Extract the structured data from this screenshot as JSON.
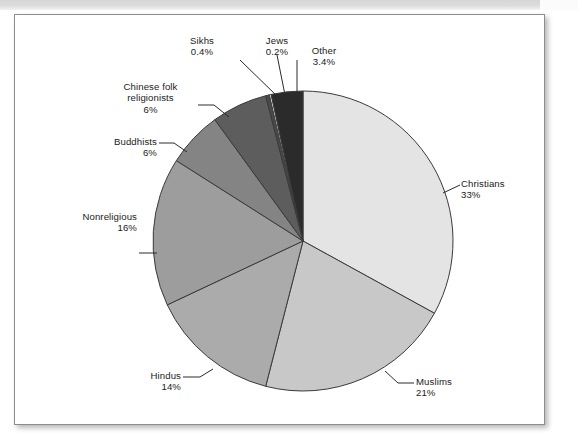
{
  "figure": {
    "background_color": "#ffffff",
    "frame_border_color": "#8d8d8d"
  },
  "chart_data": {
    "type": "pie",
    "title": "",
    "subtitle": "",
    "xlabel": "",
    "ylabel": "",
    "legend_position": "none (labels with leader lines outside slices)",
    "grid": false,
    "start_angle_deg": 0,
    "direction": "clockwise from 12 o'clock",
    "categories": [
      "Christians",
      "Muslims",
      "Hindus",
      "Nonreligious",
      "Buddhists",
      "Chinese folk religionists",
      "Sikhs",
      "Jews",
      "Other"
    ],
    "values": [
      33,
      21,
      14,
      16,
      6,
      6,
      0.4,
      0.2,
      3.4
    ],
    "value_labels": [
      "33%",
      "21%",
      "14%",
      "16%",
      "6%",
      "6%",
      "0.4%",
      "0.2%",
      "3.4%"
    ],
    "colors": [
      "#e4e4e4",
      "#c8c8c8",
      "#ababab",
      "#9d9d9d",
      "#848484",
      "#5d5d5d",
      "#4a4a4a",
      "#f3f3f3",
      "#2b2b2b"
    ],
    "slice_edge_color": "#3a3a3a",
    "slices": [
      {
        "label": "Christians",
        "value": 33,
        "value_label": "33%",
        "color": "#e4e4e4"
      },
      {
        "label": "Muslims",
        "value": 21,
        "value_label": "21%",
        "color": "#c8c8c8"
      },
      {
        "label": "Hindus",
        "value": 14,
        "value_label": "14%",
        "color": "#ababab"
      },
      {
        "label": "Nonreligious",
        "value": 16,
        "value_label": "16%",
        "color": "#9d9d9d"
      },
      {
        "label": "Buddhists",
        "value": 6,
        "value_label": "6%",
        "color": "#848484"
      },
      {
        "label": "Chinese folk religionists",
        "value": 6,
        "value_label": "6%",
        "color": "#5d5d5d"
      },
      {
        "label": "Sikhs",
        "value": 0.4,
        "value_label": "0.4%",
        "color": "#4a4a4a"
      },
      {
        "label": "Jews",
        "value": 0.2,
        "value_label": "0.2%",
        "color": "#f3f3f3"
      },
      {
        "label": "Other",
        "value": 3.4,
        "value_label": "3.4%",
        "color": "#2b2b2b"
      }
    ]
  },
  "labels": {
    "christians": {
      "name": "Christians",
      "pct": "33%"
    },
    "muslims": {
      "name": "Muslims",
      "pct": "21%"
    },
    "hindus": {
      "name": "Hindus",
      "pct": "14%"
    },
    "nonreligious": {
      "name": "Nonreligious",
      "pct": "16%"
    },
    "buddhists": {
      "name": "Buddhists",
      "pct": "6%"
    },
    "chinese_folk_line1": "Chinese folk",
    "chinese_folk_line2": "religionists",
    "chinese_folk_pct": "6%",
    "sikhs": {
      "name": "Sikhs",
      "pct": "0.4%"
    },
    "jews": {
      "name": "Jews",
      "pct": "0.2%"
    },
    "other": {
      "name": "Other",
      "pct": "3.4%"
    }
  }
}
